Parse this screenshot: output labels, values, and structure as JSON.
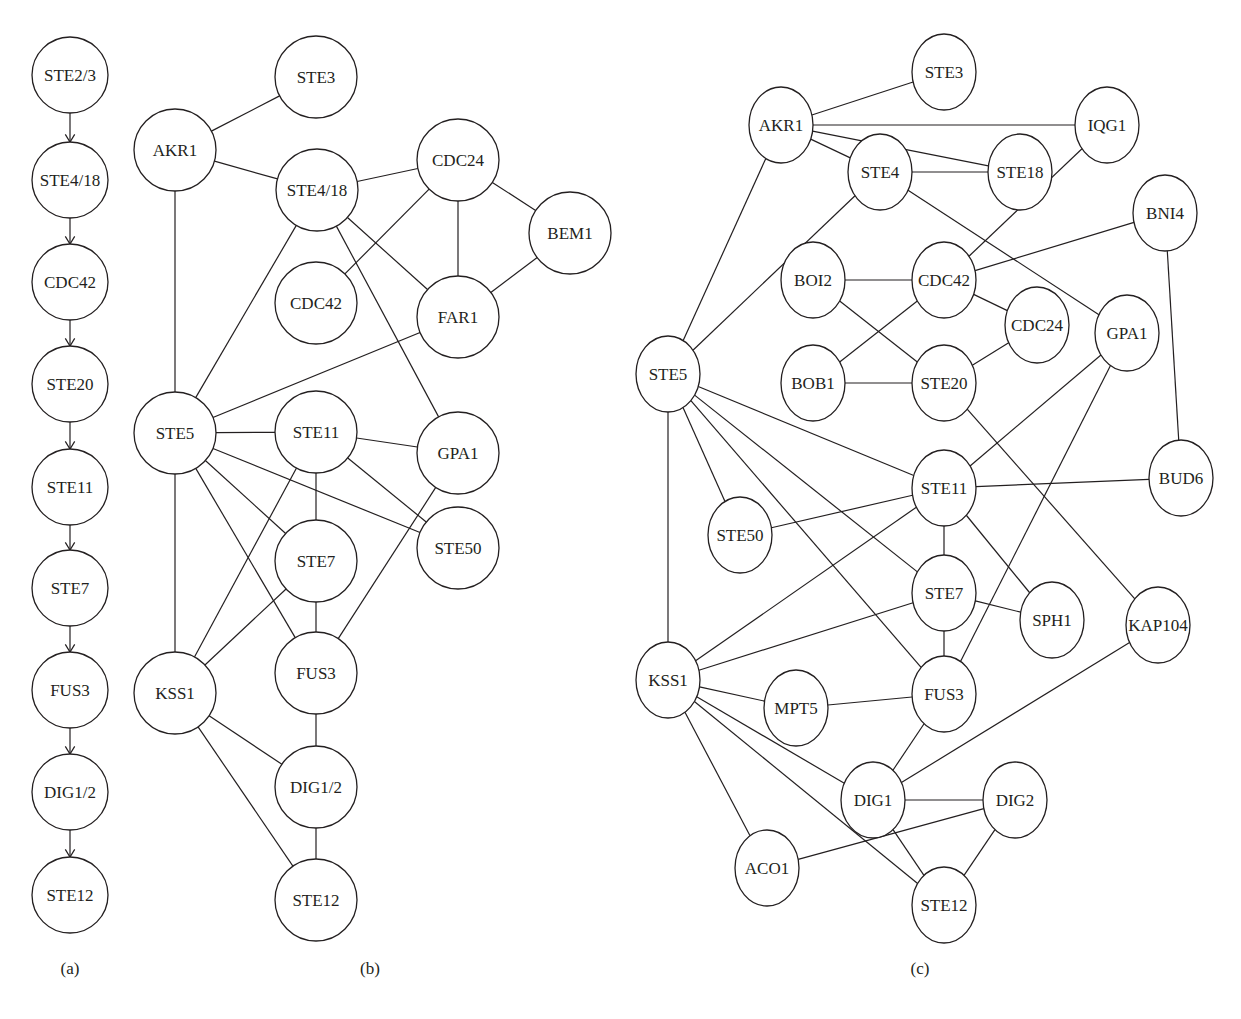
{
  "figure": {
    "stroke_color": "#231f20",
    "background": "#ffffff",
    "panels": [
      {
        "id": "a",
        "caption": "(a)",
        "caption_pos": [
          70,
          968
        ],
        "directed": true,
        "node_rx": 38,
        "node_ry": 38,
        "nodes": [
          {
            "id": "STE2/3",
            "x": 70,
            "y": 75
          },
          {
            "id": "STE4/18",
            "x": 70,
            "y": 180
          },
          {
            "id": "CDC42",
            "x": 70,
            "y": 282
          },
          {
            "id": "STE20",
            "x": 70,
            "y": 384
          },
          {
            "id": "STE11",
            "x": 70,
            "y": 487
          },
          {
            "id": "STE7",
            "x": 70,
            "y": 588
          },
          {
            "id": "FUS3",
            "x": 70,
            "y": 690
          },
          {
            "id": "DIG1/2",
            "x": 70,
            "y": 792
          },
          {
            "id": "STE12",
            "x": 70,
            "y": 895
          }
        ],
        "edges": [
          [
            "STE2/3",
            "STE4/18"
          ],
          [
            "STE4/18",
            "CDC42"
          ],
          [
            "CDC42",
            "STE20"
          ],
          [
            "STE20",
            "STE11"
          ],
          [
            "STE11",
            "STE7"
          ],
          [
            "STE7",
            "FUS3"
          ],
          [
            "FUS3",
            "DIG1/2"
          ],
          [
            "DIG1/2",
            "STE12"
          ]
        ]
      },
      {
        "id": "b",
        "caption": "(b)",
        "caption_pos": [
          370,
          968
        ],
        "directed": false,
        "node_rx": 41,
        "node_ry": 41,
        "nodes": [
          {
            "id": "STE3",
            "x": 316,
            "y": 77
          },
          {
            "id": "AKR1",
            "x": 175,
            "y": 150
          },
          {
            "id": "STE4/18",
            "x": 317,
            "y": 190
          },
          {
            "id": "CDC24",
            "x": 458,
            "y": 160
          },
          {
            "id": "BEM1",
            "x": 570,
            "y": 233
          },
          {
            "id": "CDC42",
            "x": 316,
            "y": 303
          },
          {
            "id": "FAR1",
            "x": 458,
            "y": 317
          },
          {
            "id": "STE5",
            "x": 175,
            "y": 433
          },
          {
            "id": "STE11",
            "x": 316,
            "y": 432
          },
          {
            "id": "GPA1",
            "x": 458,
            "y": 453
          },
          {
            "id": "STE50",
            "x": 458,
            "y": 548
          },
          {
            "id": "STE7",
            "x": 316,
            "y": 561
          },
          {
            "id": "FUS3",
            "x": 316,
            "y": 673
          },
          {
            "id": "KSS1",
            "x": 175,
            "y": 693
          },
          {
            "id": "DIG1/2",
            "x": 316,
            "y": 787
          },
          {
            "id": "STE12",
            "x": 316,
            "y": 900
          }
        ],
        "edges": [
          [
            "AKR1",
            "STE3"
          ],
          [
            "AKR1",
            "STE4/18"
          ],
          [
            "AKR1",
            "STE5"
          ],
          [
            "STE4/18",
            "CDC24"
          ],
          [
            "STE4/18",
            "STE5"
          ],
          [
            "STE4/18",
            "FAR1"
          ],
          [
            "STE4/18",
            "GPA1"
          ],
          [
            "CDC24",
            "CDC42"
          ],
          [
            "CDC24",
            "FAR1"
          ],
          [
            "CDC24",
            "BEM1"
          ],
          [
            "BEM1",
            "FAR1"
          ],
          [
            "FAR1",
            "STE5"
          ],
          [
            "STE5",
            "STE11"
          ],
          [
            "STE5",
            "STE7"
          ],
          [
            "STE5",
            "FUS3"
          ],
          [
            "STE5",
            "STE50"
          ],
          [
            "STE5",
            "KSS1"
          ],
          [
            "STE11",
            "GPA1"
          ],
          [
            "STE11",
            "STE50"
          ],
          [
            "STE11",
            "STE7"
          ],
          [
            "STE11",
            "KSS1"
          ],
          [
            "STE7",
            "KSS1"
          ],
          [
            "STE7",
            "FUS3"
          ],
          [
            "GPA1",
            "FUS3"
          ],
          [
            "FUS3",
            "DIG1/2"
          ],
          [
            "KSS1",
            "DIG1/2"
          ],
          [
            "KSS1",
            "STE12"
          ],
          [
            "DIG1/2",
            "STE12"
          ]
        ]
      },
      {
        "id": "c",
        "caption": "(c)",
        "caption_pos": [
          920,
          968
        ],
        "directed": false,
        "node_rx": 32,
        "node_ry": 38,
        "nodes": [
          {
            "id": "STE3",
            "x": 944,
            "y": 72
          },
          {
            "id": "AKR1",
            "x": 781,
            "y": 125
          },
          {
            "id": "IQG1",
            "x": 1107,
            "y": 125
          },
          {
            "id": "STE4",
            "x": 880,
            "y": 172
          },
          {
            "id": "STE18",
            "x": 1020,
            "y": 172
          },
          {
            "id": "BNI4",
            "x": 1165,
            "y": 213
          },
          {
            "id": "BOI2",
            "x": 813,
            "y": 280
          },
          {
            "id": "CDC42",
            "x": 944,
            "y": 280
          },
          {
            "id": "CDC24",
            "x": 1037,
            "y": 325
          },
          {
            "id": "GPA1",
            "x": 1127,
            "y": 333
          },
          {
            "id": "STE5",
            "x": 668,
            "y": 374
          },
          {
            "id": "BOB1",
            "x": 813,
            "y": 383
          },
          {
            "id": "STE20",
            "x": 944,
            "y": 383
          },
          {
            "id": "STE11",
            "x": 944,
            "y": 488
          },
          {
            "id": "BUD6",
            "x": 1181,
            "y": 478
          },
          {
            "id": "STE50",
            "x": 740,
            "y": 535
          },
          {
            "id": "STE7",
            "x": 944,
            "y": 593
          },
          {
            "id": "SPH1",
            "x": 1052,
            "y": 620
          },
          {
            "id": "KAP104",
            "x": 1158,
            "y": 625
          },
          {
            "id": "KSS1",
            "x": 668,
            "y": 680
          },
          {
            "id": "MPT5",
            "x": 796,
            "y": 708
          },
          {
            "id": "FUS3",
            "x": 944,
            "y": 694
          },
          {
            "id": "DIG1",
            "x": 873,
            "y": 800
          },
          {
            "id": "DIG2",
            "x": 1015,
            "y": 800
          },
          {
            "id": "ACO1",
            "x": 767,
            "y": 868
          },
          {
            "id": "STE12",
            "x": 944,
            "y": 905
          }
        ],
        "edges": [
          [
            "AKR1",
            "STE3"
          ],
          [
            "AKR1",
            "IQG1"
          ],
          [
            "AKR1",
            "STE18"
          ],
          [
            "AKR1",
            "STE4"
          ],
          [
            "AKR1",
            "STE5"
          ],
          [
            "STE4",
            "STE18"
          ],
          [
            "STE4",
            "STE5"
          ],
          [
            "STE4",
            "GPA1"
          ],
          [
            "IQG1",
            "CDC42"
          ],
          [
            "BNI4",
            "CDC42"
          ],
          [
            "BNI4",
            "BUD6"
          ],
          [
            "BOI2",
            "CDC42"
          ],
          [
            "BOI2",
            "STE20"
          ],
          [
            "BOB1",
            "CDC42"
          ],
          [
            "BOB1",
            "STE20"
          ],
          [
            "CDC42",
            "CDC24"
          ],
          [
            "CDC24",
            "STE20"
          ],
          [
            "STE20",
            "KAP104"
          ],
          [
            "GPA1",
            "STE11"
          ],
          [
            "GPA1",
            "FUS3"
          ],
          [
            "STE5",
            "STE11"
          ],
          [
            "STE5",
            "STE50"
          ],
          [
            "STE5",
            "STE7"
          ],
          [
            "STE5",
            "FUS3"
          ],
          [
            "STE5",
            "KSS1"
          ],
          [
            "STE11",
            "STE50"
          ],
          [
            "STE11",
            "BUD6"
          ],
          [
            "STE11",
            "STE7"
          ],
          [
            "STE11",
            "SPH1"
          ],
          [
            "STE11",
            "KSS1"
          ],
          [
            "STE7",
            "SPH1"
          ],
          [
            "STE7",
            "KSS1"
          ],
          [
            "STE7",
            "FUS3"
          ],
          [
            "KSS1",
            "MPT5"
          ],
          [
            "KSS1",
            "DIG1"
          ],
          [
            "KSS1",
            "STE12"
          ],
          [
            "KSS1",
            "ACO1"
          ],
          [
            "MPT5",
            "FUS3"
          ],
          [
            "FUS3",
            "DIG1"
          ],
          [
            "KAP104",
            "DIG1"
          ],
          [
            "DIG1",
            "DIG2"
          ],
          [
            "DIG1",
            "STE12"
          ],
          [
            "DIG2",
            "STE12"
          ],
          [
            "DIG2",
            "ACO1"
          ]
        ]
      }
    ]
  }
}
